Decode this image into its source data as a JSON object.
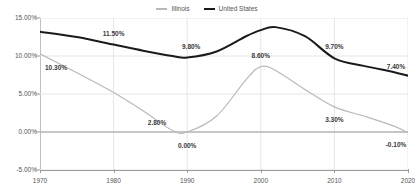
{
  "chart_data": {
    "type": "line",
    "title": "",
    "subtitle": "",
    "xlabel": "",
    "ylabel": "",
    "xlim": [
      1970,
      2020
    ],
    "ylim": [
      -5,
      15
    ],
    "grid": true,
    "grid_axis": "both",
    "legend_position": "top-center",
    "x_ticks": [
      "1970",
      "1980",
      "1990",
      "2000",
      "2010",
      "2020"
    ],
    "x_tick_values": [
      1970,
      1980,
      1990,
      2000,
      2010,
      2020
    ],
    "y_ticks": [
      "-5.00%",
      "0.00%",
      "5.00%",
      "10.00%",
      "15.00%"
    ],
    "y_tick_values": [
      -5,
      0,
      5,
      10,
      15
    ],
    "series": [
      {
        "name": "Illinois",
        "color": "#b9b9b9",
        "x": [
          1970,
          1975,
          1980,
          1984,
          1988,
          1990,
          1994,
          1998,
          2000,
          2002,
          2006,
          2010,
          2014,
          2018,
          2020
        ],
        "values": [
          10.3,
          7.8,
          5.2,
          2.8,
          0.2,
          0.0,
          2.1,
          6.9,
          8.6,
          8.1,
          5.6,
          3.3,
          2.1,
          0.8,
          -0.1
        ],
        "labels": [
          {
            "x": 1970,
            "y": 10.3,
            "text": "10.30%"
          },
          {
            "x": 1984,
            "y": 2.8,
            "text": "2.80%"
          },
          {
            "x": 1990,
            "y": 0.0,
            "text": "0.00%"
          },
          {
            "x": 2000,
            "y": 8.6,
            "text": "8.60%"
          },
          {
            "x": 2010,
            "y": 3.3,
            "text": "3.30%"
          },
          {
            "x": 2020,
            "y": -0.1,
            "text": "-0.10%"
          }
        ]
      },
      {
        "name": "United States",
        "color": "#1a1a1a",
        "x": [
          1970,
          1975,
          1980,
          1984,
          1988,
          1990,
          1994,
          1998,
          2000,
          2002,
          2006,
          2010,
          2014,
          2018,
          2020
        ],
        "values": [
          13.2,
          12.5,
          11.5,
          10.7,
          10.0,
          9.8,
          10.6,
          12.6,
          13.4,
          13.8,
          12.6,
          9.7,
          8.7,
          7.9,
          7.4
        ],
        "labels": [
          {
            "x": 1980,
            "y": 11.5,
            "text": "11.50%"
          },
          {
            "x": 1990,
            "y": 9.8,
            "text": "9.80%"
          },
          {
            "x": 2010,
            "y": 9.7,
            "text": "9.70%"
          },
          {
            "x": 2020,
            "y": 7.4,
            "text": "7.40%"
          }
        ]
      }
    ]
  },
  "legend": {
    "items": [
      {
        "label": "Illinois",
        "color": "#b9b9b9"
      },
      {
        "label": "United States",
        "color": "#1a1a1a"
      }
    ]
  },
  "colors": {
    "illinois": "#b9b9b9",
    "united_states": "#1a1a1a",
    "axis": "#9a9a9a",
    "grid": "#e6e6e6",
    "text": "#555555",
    "background": "#ffffff"
  }
}
